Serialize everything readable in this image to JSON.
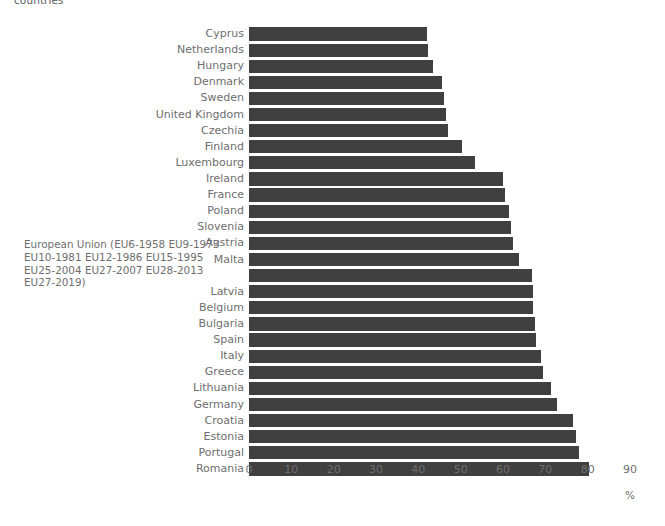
{
  "title": "countries",
  "axis_unit": "%",
  "colors": {
    "bar": "#404040",
    "label_text": "#6e6e6e",
    "background": "#ffffff"
  },
  "eu_annotation": "European Union (EU6-1958 EU9-1973\nEU10-1981 EU12-1986 EU15-1995\nEU25-2004 EU27-2007 EU28-2013\nEU27-2019)",
  "chart_data": {
    "type": "bar",
    "orientation": "horizontal",
    "title": "countries",
    "xlabel": "%",
    "ylabel": "",
    "xlim": [
      0,
      90
    ],
    "xticks": [
      0,
      10,
      20,
      30,
      40,
      50,
      60,
      70,
      80,
      90
    ],
    "grid": false,
    "legend": "none",
    "categories": [
      "Cyprus",
      "Netherlands",
      "Hungary",
      "Denmark",
      "Sweden",
      "United Kingdom",
      "Czechia",
      "Finland",
      "Luxembourg",
      "Ireland",
      "France",
      "Poland",
      "Slovenia",
      "Austria",
      "Malta",
      "European Union (EU6-1958 EU9-1973 EU10-1981 EU12-1986 EU15-1995 EU25-2004 EU27-2007 EU28-2013 EU27-2019)",
      "Latvia",
      "Belgium",
      "Bulgaria",
      "Spain",
      "Italy",
      "Greece",
      "Lithuania",
      "Germany",
      "Croatia",
      "Estonia",
      "Portugal",
      "Romania"
    ],
    "values": [
      42.0,
      42.2,
      43.5,
      45.5,
      46.0,
      46.5,
      47.0,
      50.2,
      53.5,
      60.0,
      60.4,
      61.3,
      61.8,
      62.3,
      63.7,
      66.8,
      67.0,
      67.2,
      67.5,
      67.8,
      69.0,
      69.4,
      71.3,
      72.7,
      76.5,
      77.2,
      77.9,
      80.3
    ]
  }
}
